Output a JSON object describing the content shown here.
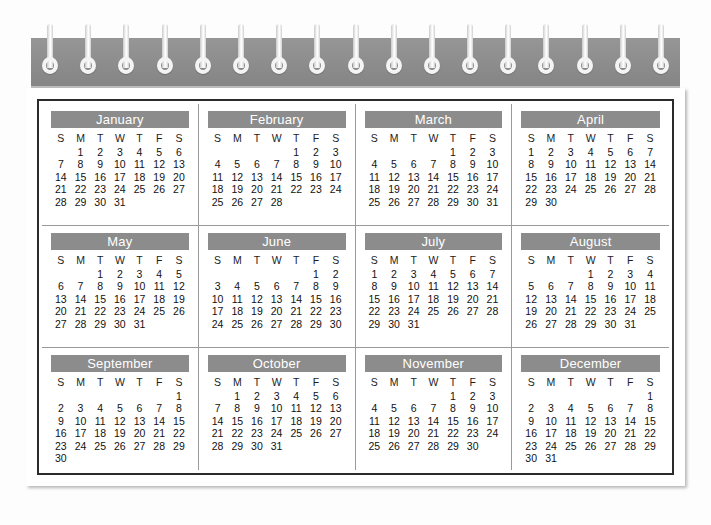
{
  "calendar": {
    "weekday_headers": [
      "S",
      "M",
      "T",
      "W",
      "T",
      "F",
      "S"
    ],
    "binding": {
      "ring_count": 17,
      "strip_color": "#8f8f8f",
      "ring_color": "#f4f4f4"
    },
    "colors": {
      "month_header_bg": "#8c8c8c",
      "month_header_text": "#ffffff",
      "page_bg": "#ffffff",
      "frame_border": "#2b2b2b",
      "grid_line": "#9a9a9a",
      "day_text": "#111111"
    },
    "months": [
      {
        "name": "January",
        "start_weekday": 1,
        "days": 31,
        "weeks": [
          [
            "",
            "1",
            "2",
            "3",
            "4",
            "5",
            "6"
          ],
          [
            "7",
            "8",
            "9",
            "10",
            "11",
            "12",
            "13"
          ],
          [
            "14",
            "15",
            "16",
            "17",
            "18",
            "19",
            "20"
          ],
          [
            "21",
            "22",
            "23",
            "24",
            "25",
            "26",
            "27"
          ],
          [
            "28",
            "29",
            "30",
            "31",
            "",
            "",
            ""
          ]
        ]
      },
      {
        "name": "February",
        "start_weekday": 4,
        "days": 28,
        "weeks": [
          [
            "",
            "",
            "",
            "",
            "1",
            "2",
            "3"
          ],
          [
            "4",
            "5",
            "6",
            "7",
            "8",
            "9",
            "10"
          ],
          [
            "11",
            "12",
            "13",
            "14",
            "15",
            "16",
            "17"
          ],
          [
            "18",
            "19",
            "20",
            "21",
            "22",
            "23",
            "24"
          ],
          [
            "25",
            "26",
            "27",
            "28",
            "",
            "",
            ""
          ]
        ]
      },
      {
        "name": "March",
        "start_weekday": 4,
        "days": 31,
        "weeks": [
          [
            "",
            "",
            "",
            "",
            "1",
            "2",
            "3"
          ],
          [
            "4",
            "5",
            "6",
            "7",
            "8",
            "9",
            "10"
          ],
          [
            "11",
            "12",
            "13",
            "14",
            "15",
            "16",
            "17"
          ],
          [
            "18",
            "19",
            "20",
            "21",
            "22",
            "23",
            "24"
          ],
          [
            "25",
            "26",
            "27",
            "28",
            "29",
            "30",
            "31"
          ]
        ]
      },
      {
        "name": "April",
        "start_weekday": 0,
        "days": 30,
        "weeks": [
          [
            "1",
            "2",
            "3",
            "4",
            "5",
            "6",
            "7"
          ],
          [
            "8",
            "9",
            "10",
            "11",
            "12",
            "13",
            "14"
          ],
          [
            "15",
            "16",
            "17",
            "18",
            "19",
            "20",
            "21"
          ],
          [
            "22",
            "23",
            "24",
            "25",
            "26",
            "27",
            "28"
          ],
          [
            "29",
            "30",
            "",
            "",
            "",
            "",
            ""
          ]
        ]
      },
      {
        "name": "May",
        "start_weekday": 2,
        "days": 31,
        "weeks": [
          [
            "",
            "",
            "1",
            "2",
            "3",
            "4",
            "5"
          ],
          [
            "6",
            "7",
            "8",
            "9",
            "10",
            "11",
            "12"
          ],
          [
            "13",
            "14",
            "15",
            "16",
            "17",
            "18",
            "19"
          ],
          [
            "20",
            "21",
            "22",
            "23",
            "24",
            "25",
            "26"
          ],
          [
            "27",
            "28",
            "29",
            "30",
            "31",
            "",
            ""
          ]
        ]
      },
      {
        "name": "June",
        "start_weekday": 5,
        "days": 30,
        "weeks": [
          [
            "",
            "",
            "",
            "",
            "",
            "1",
            "2"
          ],
          [
            "3",
            "4",
            "5",
            "6",
            "7",
            "8",
            "9"
          ],
          [
            "10",
            "11",
            "12",
            "13",
            "14",
            "15",
            "16"
          ],
          [
            "17",
            "18",
            "19",
            "20",
            "21",
            "22",
            "23"
          ],
          [
            "24",
            "25",
            "26",
            "27",
            "28",
            "29",
            "30"
          ]
        ]
      },
      {
        "name": "July",
        "start_weekday": 0,
        "days": 31,
        "weeks": [
          [
            "1",
            "2",
            "3",
            "4",
            "5",
            "6",
            "7"
          ],
          [
            "8",
            "9",
            "10",
            "11",
            "12",
            "13",
            "14"
          ],
          [
            "15",
            "16",
            "17",
            "18",
            "19",
            "20",
            "21"
          ],
          [
            "22",
            "23",
            "24",
            "25",
            "26",
            "27",
            "28"
          ],
          [
            "29",
            "30",
            "31",
            "",
            "",
            "",
            ""
          ]
        ]
      },
      {
        "name": "August",
        "start_weekday": 3,
        "days": 31,
        "weeks": [
          [
            "",
            "",
            "",
            "1",
            "2",
            "3",
            "4"
          ],
          [
            "5",
            "6",
            "7",
            "8",
            "9",
            "10",
            "11"
          ],
          [
            "12",
            "13",
            "14",
            "15",
            "16",
            "17",
            "18"
          ],
          [
            "19",
            "20",
            "21",
            "22",
            "23",
            "24",
            "25"
          ],
          [
            "26",
            "27",
            "28",
            "29",
            "30",
            "31",
            ""
          ]
        ]
      },
      {
        "name": "September",
        "start_weekday": 6,
        "days": 30,
        "weeks": [
          [
            "",
            "",
            "",
            "",
            "",
            "",
            "1"
          ],
          [
            "2",
            "3",
            "4",
            "5",
            "6",
            "7",
            "8"
          ],
          [
            "9",
            "10",
            "11",
            "12",
            "13",
            "14",
            "15"
          ],
          [
            "16",
            "17",
            "18",
            "19",
            "20",
            "21",
            "22"
          ],
          [
            "23",
            "24",
            "25",
            "26",
            "27",
            "28",
            "29"
          ],
          [
            "30",
            "",
            "",
            "",
            "",
            "",
            ""
          ]
        ]
      },
      {
        "name": "October",
        "start_weekday": 1,
        "days": 31,
        "weeks": [
          [
            "",
            "1",
            "2",
            "3",
            "4",
            "5",
            "6"
          ],
          [
            "7",
            "8",
            "9",
            "10",
            "11",
            "12",
            "13"
          ],
          [
            "14",
            "15",
            "16",
            "17",
            "18",
            "19",
            "20"
          ],
          [
            "21",
            "22",
            "23",
            "24",
            "25",
            "26",
            "27"
          ],
          [
            "28",
            "29",
            "30",
            "31",
            "",
            "",
            ""
          ]
        ]
      },
      {
        "name": "November",
        "start_weekday": 4,
        "days": 30,
        "weeks": [
          [
            "",
            "",
            "",
            "",
            "1",
            "2",
            "3"
          ],
          [
            "4",
            "5",
            "6",
            "7",
            "8",
            "9",
            "10"
          ],
          [
            "11",
            "12",
            "13",
            "14",
            "15",
            "16",
            "17"
          ],
          [
            "18",
            "19",
            "20",
            "21",
            "22",
            "23",
            "24"
          ],
          [
            "25",
            "26",
            "27",
            "28",
            "29",
            "30",
            ""
          ]
        ]
      },
      {
        "name": "December",
        "start_weekday": 6,
        "days": 31,
        "weeks": [
          [
            "",
            "",
            "",
            "",
            "",
            "",
            "1"
          ],
          [
            "2",
            "3",
            "4",
            "5",
            "6",
            "7",
            "8"
          ],
          [
            "9",
            "10",
            "11",
            "12",
            "13",
            "14",
            "15"
          ],
          [
            "16",
            "17",
            "18",
            "19",
            "20",
            "21",
            "22"
          ],
          [
            "23",
            "24",
            "25",
            "26",
            "27",
            "28",
            "29"
          ],
          [
            "30",
            "31",
            "",
            "",
            "",
            "",
            ""
          ]
        ]
      }
    ]
  }
}
